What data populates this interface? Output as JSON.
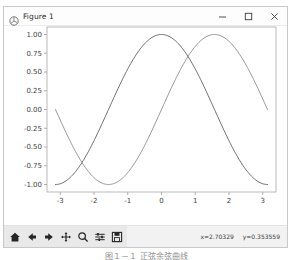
{
  "window": {
    "title": "Figure 1",
    "app_icon": "matplotlib-figure-icon",
    "controls": {
      "minimize_label": "–",
      "maximize_label": "□",
      "close_label": "×"
    }
  },
  "toolbar": {
    "buttons": [
      {
        "name": "home-icon",
        "tooltip": "Home"
      },
      {
        "name": "back-arrow-icon",
        "tooltip": "Back"
      },
      {
        "name": "forward-arrow-icon",
        "tooltip": "Forward"
      },
      {
        "name": "pan-move-icon",
        "tooltip": "Pan"
      },
      {
        "name": "zoom-magnifier-icon",
        "tooltip": "Zoom to rectangle"
      },
      {
        "name": "configure-subplots-icon",
        "tooltip": "Configure subplots"
      },
      {
        "name": "save-disk-icon",
        "tooltip": "Save the figure"
      }
    ],
    "cursor_x": "x=2.70329",
    "cursor_y": "y=0.353559"
  },
  "caption": "图１－１  正弦余弦曲线",
  "colors": {
    "curve_1": "#4a4a4a",
    "curve_2": "#7d7d7d",
    "axes_frame": "#a8a8a8",
    "tick": "#9a9a9a",
    "window_border": "#c9c9c9",
    "toolbar_bg": "#f2f2f2"
  },
  "chart_data": {
    "type": "line",
    "title": "",
    "xlabel": "",
    "ylabel": "",
    "xlim": [
      -3.3929,
      3.3929
    ],
    "ylim": [
      -1.1,
      1.1
    ],
    "xticks": [
      -3,
      -2,
      -1,
      0,
      1,
      2,
      3
    ],
    "xticklabels": [
      "-3",
      "-2",
      "-1",
      "0",
      "1",
      "2",
      "3"
    ],
    "yticks": [
      -1.0,
      -0.75,
      -0.5,
      -0.25,
      0.0,
      0.25,
      0.5,
      0.75,
      1.0
    ],
    "yticklabels": [
      "-1.00",
      "-0.75",
      "-0.50",
      "-0.25",
      "0.00",
      "0.25",
      "0.50",
      "0.75",
      "1.00"
    ],
    "grid": false,
    "legend": null,
    "x_domain": [
      -3.14159,
      3.14159
    ],
    "n_points": 201,
    "series": [
      {
        "name": "cos(x)",
        "formula": "cos",
        "phase": 0,
        "color": "#4a4a4a",
        "linewidth": 0.8,
        "endpoints": {
          "x_start": -3.14159,
          "y_start": -1.0,
          "x_end": 3.14159,
          "y_end": -1.0
        },
        "peak": {
          "x": 0,
          "y": 1.0
        }
      },
      {
        "name": "sin(x + pi/2 shifted)",
        "formula": "cos_shifted",
        "phase": -1.5708,
        "color": "#7d7d7d",
        "linewidth": 0.8,
        "endpoints": {
          "x_start": -3.14159,
          "y_start": 0.15,
          "x_end": 3.14159,
          "y_end": 0.3
        },
        "peak": {
          "x": 1.5708,
          "y": 1.0
        }
      }
    ]
  }
}
